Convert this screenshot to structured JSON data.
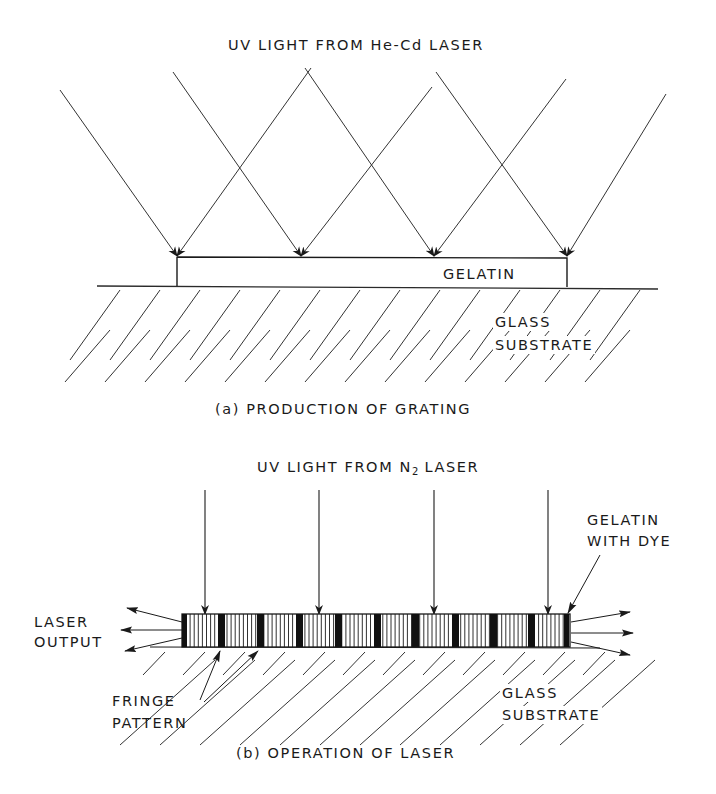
{
  "figure_a": {
    "title": "UV LIGHT FROM He-Cd LASER",
    "gelatin_label": "GELATIN",
    "substrate_label_line1": "GLASS",
    "substrate_label_line2": "SUBSTRATE",
    "caption": "(a) PRODUCTION OF GRATING",
    "beam_tips_x": [
      177,
      301,
      434,
      567
    ],
    "beams_down_right": [
      [
        60,
        90,
        177,
        256
      ],
      [
        173,
        72,
        301,
        256
      ],
      [
        305,
        68,
        434,
        256
      ],
      [
        436,
        72,
        567,
        256
      ]
    ],
    "beams_down_left": [
      [
        311,
        68,
        177,
        256
      ],
      [
        432,
        87,
        301,
        256
      ],
      [
        566,
        79,
        434,
        256
      ],
      [
        666,
        94,
        567,
        256
      ]
    ]
  },
  "figure_b": {
    "title_prefix": "UV LIGHT FROM N",
    "title_subscript": "2",
    "title_suffix": " LASER",
    "output_label_line1": "LASER",
    "output_label_line2": "OUTPUT",
    "fringe_label_line1": "FRINGE",
    "fringe_label_line2": "PATTERN",
    "gelatin_label_line1": "GELATIN",
    "gelatin_label_line2": "WITH DYE",
    "substrate_label_line1": "GLASS",
    "substrate_label_line2": "SUBSTRATE",
    "caption": "(b) OPERATION OF LASER",
    "pump_arrows_x": [
      205,
      319,
      434,
      548
    ],
    "slab": {
      "x1": 182,
      "x2": 570,
      "y1": 614,
      "y2": 647
    },
    "dark_fringes_x": [
      182,
      218,
      257,
      296,
      335,
      374,
      412,
      452,
      490,
      528,
      564
    ]
  },
  "colors": {
    "ink": "#1a1a1a",
    "background": "#ffffff"
  }
}
